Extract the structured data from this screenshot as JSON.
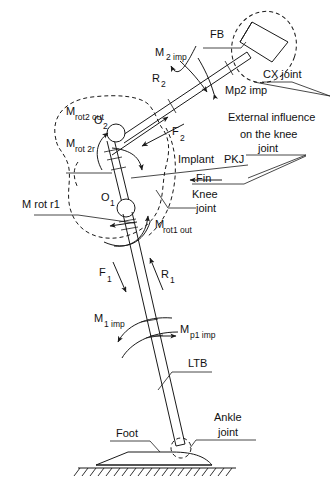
{
  "figure": {
    "type": "biomechanical-free-body-diagram",
    "background_color": "#ffffff",
    "line_color": "#1a1a1a",
    "text_color": "#111111",
    "width": 333,
    "height": 482
  },
  "labels": {
    "fb": "FB",
    "cx_joint": "CX joint",
    "mp2_imp": "Mp2 imp",
    "m_2_imp_main": "M",
    "m_2_imp_sub": "2 imp",
    "r2_main": "R",
    "r2_sub": "2",
    "m_rot2_out_main": "M",
    "m_rot2_out_sub": "rot2 out",
    "m_rot_2r_main": "M",
    "m_rot_2r_sub": "rot 2r",
    "o2_main": "O",
    "o2_sub": "2",
    "o1_main": "O",
    "o1_sub": "1",
    "f2_main": "F",
    "f2_sub": "2",
    "external_line1": "External influence",
    "external_line2": "on the knee",
    "external_line3": "joint",
    "implant": "Implant",
    "pkj": "PKJ",
    "fin": "Fin",
    "knee": "Knee",
    "joint": "joint",
    "m_rot_r1": "M rot r1",
    "m_rot1_out_main": "M",
    "m_rot1_out_sub": "rot1 out",
    "f1_main": "F",
    "f1_sub": "1",
    "r1_main": "R",
    "r1_sub": "1",
    "m_1_imp_main": "M",
    "m_1_imp_sub": "1 imp",
    "m_p1_imp_main": "M",
    "m_p1_imp_sub": "p1 imp",
    "ltb": "LTB",
    "foot": "Foot",
    "ankle_line1": "Ankle",
    "ankle_line2": "joint"
  },
  "components": [
    {
      "name": "cx-joint-block",
      "description": "hatched fixation plate at top right inside dashed ellipse"
    },
    {
      "name": "femur-rod",
      "description": "upper inclined double-line rod from O2 to CX joint"
    },
    {
      "name": "implant-rod",
      "description": "short rod between ball joints O1 and O2"
    },
    {
      "name": "tibia-rod",
      "description": "long lower rod (LTB) from O1 to ankle joint"
    },
    {
      "name": "ball-joint-o2",
      "description": "spherical joint at upper end of implant"
    },
    {
      "name": "ball-joint-o1",
      "description": "spherical joint at lower end of implant"
    },
    {
      "name": "ankle-joint",
      "description": "dashed spherical joint at foot"
    },
    {
      "name": "foot-base",
      "description": "foot profile resting on hatched ground"
    },
    {
      "name": "ground-hatching",
      "description": "hatched ground support line"
    },
    {
      "name": "knee-region-outline",
      "description": "dashed blob enclosing knee joint region"
    },
    {
      "name": "cx-region-outline",
      "description": "dashed ellipse enclosing CX joint"
    }
  ]
}
